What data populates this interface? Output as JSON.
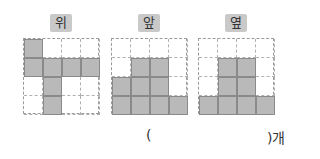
{
  "views": [
    {
      "label": "위",
      "left": 23,
      "filled": [
        [
          1,
          0,
          0,
          0
        ],
        [
          1,
          1,
          1,
          1
        ],
        [
          0,
          1,
          0,
          0
        ],
        [
          0,
          1,
          0,
          0
        ]
      ]
    },
    {
      "label": "앞",
      "left": 111,
      "filled": [
        [
          0,
          0,
          0,
          0
        ],
        [
          0,
          1,
          1,
          0
        ],
        [
          1,
          1,
          1,
          0
        ],
        [
          1,
          1,
          1,
          1
        ]
      ]
    },
    {
      "label": "옆",
      "left": 198,
      "filled": [
        [
          0,
          0,
          0,
          0
        ],
        [
          0,
          1,
          1,
          0
        ],
        [
          0,
          1,
          1,
          0
        ],
        [
          1,
          1,
          1,
          1
        ]
      ]
    }
  ],
  "answer": {
    "open_paren": "(",
    "close_paren": ")",
    "unit": "개",
    "value": ""
  }
}
